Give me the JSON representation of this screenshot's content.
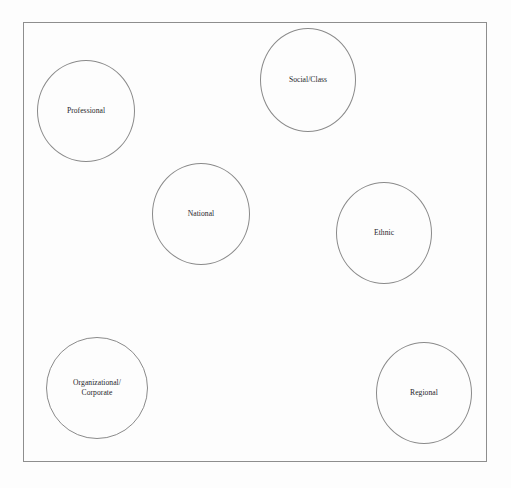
{
  "diagram": {
    "type": "labeled-circles",
    "background_color": "#fdfdfd",
    "frame": {
      "name": "outer-frame",
      "stroke_color": "#8e8e8e",
      "fill": "none",
      "x": 23,
      "y": 22,
      "width": 464,
      "height": 440
    },
    "node_style": {
      "stroke_color": "#8a8a8a",
      "fill": "none",
      "text_color": "#25252a"
    },
    "nodes": [
      {
        "id": "professional",
        "label": "Professional",
        "cx": 86,
        "cy": 111,
        "rx": 49,
        "ry": 51
      },
      {
        "id": "social-class",
        "label": "Social/Class",
        "cx": 308,
        "cy": 80,
        "rx": 48,
        "ry": 52
      },
      {
        "id": "national",
        "label": "National",
        "cx": 201,
        "cy": 214,
        "rx": 49,
        "ry": 51
      },
      {
        "id": "ethnic",
        "label": "Ethnic",
        "cx": 384,
        "cy": 233,
        "rx": 48,
        "ry": 51
      },
      {
        "id": "organizational-corporate",
        "label": "Organizational/\nCorporate",
        "cx": 97,
        "cy": 388,
        "rx": 51,
        "ry": 51
      },
      {
        "id": "regional",
        "label": "Regional",
        "cx": 424,
        "cy": 393,
        "rx": 48,
        "ry": 51
      }
    ]
  }
}
